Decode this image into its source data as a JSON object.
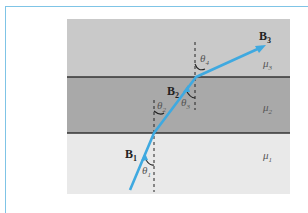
{
  "figure": {
    "layers": [
      {
        "name": "medium-3",
        "label": "μ",
        "subscript": "3",
        "color": "#c9c9c9"
      },
      {
        "name": "medium-2",
        "label": "μ",
        "subscript": "2",
        "color": "#a9a9a9"
      },
      {
        "name": "medium-1",
        "label": "μ",
        "subscript": "1",
        "color": "#e9e9e9"
      }
    ],
    "field_labels": [
      {
        "label": "B",
        "subscript": "1"
      },
      {
        "label": "B",
        "subscript": "2"
      },
      {
        "label": "B",
        "subscript": "3"
      }
    ],
    "angle_labels": [
      {
        "label": "θ",
        "subscript": "1"
      },
      {
        "label": "θ",
        "subscript": "2"
      },
      {
        "label": "θ",
        "subscript": "3"
      },
      {
        "label": "θ",
        "subscript": "4"
      }
    ],
    "colors": {
      "field_line": "#3fa9e0",
      "interface": "#333333",
      "frame": "#7fc4e6"
    }
  }
}
